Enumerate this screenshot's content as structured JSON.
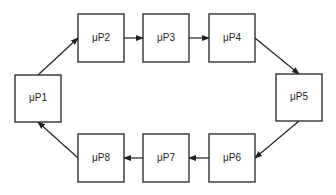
{
  "diagram": {
    "type": "ring",
    "direction": "clockwise",
    "nodes": [
      {
        "id": "p1",
        "label": "μP1",
        "x": 15,
        "y": 75,
        "w": 46,
        "h": 47
      },
      {
        "id": "p2",
        "label": "μP2",
        "x": 78,
        "y": 14,
        "w": 46,
        "h": 48
      },
      {
        "id": "p3",
        "label": "μP3",
        "x": 143,
        "y": 14,
        "w": 46,
        "h": 48
      },
      {
        "id": "p4",
        "label": "μP4",
        "x": 209,
        "y": 14,
        "w": 46,
        "h": 48
      },
      {
        "id": "p5",
        "label": "μP5",
        "x": 276,
        "y": 74,
        "w": 46,
        "h": 47
      },
      {
        "id": "p6",
        "label": "μP6",
        "x": 209,
        "y": 134,
        "w": 46,
        "h": 48
      },
      {
        "id": "p7",
        "label": "μP7",
        "x": 143,
        "y": 134,
        "w": 46,
        "h": 48
      },
      {
        "id": "p8",
        "label": "μP8",
        "x": 78,
        "y": 134,
        "w": 46,
        "h": 48
      }
    ],
    "edges": [
      {
        "from": "p1",
        "to": "p2",
        "x1": 38,
        "y1": 75,
        "x2": 78,
        "y2": 38
      },
      {
        "from": "p2",
        "to": "p3",
        "x1": 124,
        "y1": 38,
        "x2": 143,
        "y2": 38
      },
      {
        "from": "p3",
        "to": "p4",
        "x1": 189,
        "y1": 38,
        "x2": 209,
        "y2": 38
      },
      {
        "from": "p4",
        "to": "p5",
        "x1": 255,
        "y1": 38,
        "x2": 299,
        "y2": 74
      },
      {
        "from": "p5",
        "to": "p6",
        "x1": 299,
        "y1": 121,
        "x2": 255,
        "y2": 158
      },
      {
        "from": "p6",
        "to": "p7",
        "x1": 209,
        "y1": 158,
        "x2": 189,
        "y2": 158
      },
      {
        "from": "p7",
        "to": "p8",
        "x1": 143,
        "y1": 158,
        "x2": 124,
        "y2": 158
      },
      {
        "from": "p8",
        "to": "p1",
        "x1": 78,
        "y1": 158,
        "x2": 38,
        "y2": 122
      }
    ],
    "colors": {
      "stroke": "#222222",
      "fill": "#ffffff"
    }
  }
}
